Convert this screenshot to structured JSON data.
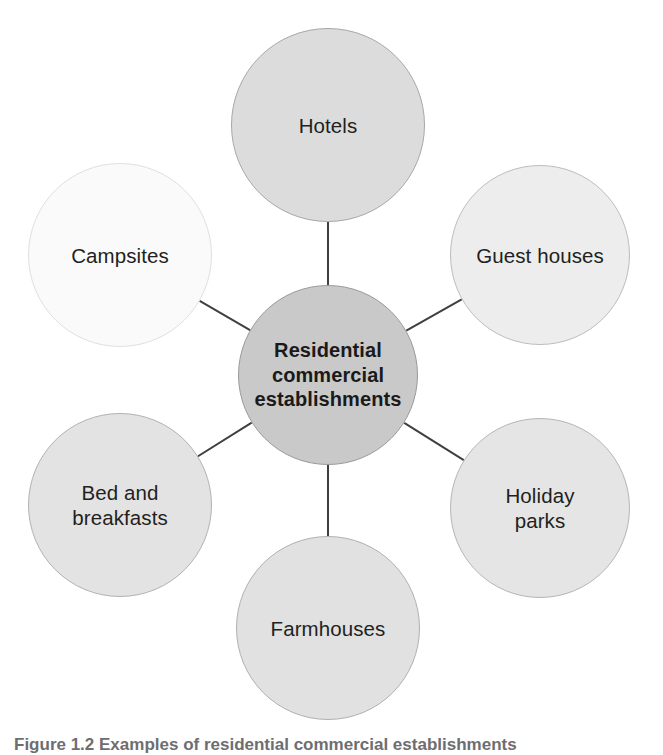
{
  "figure": {
    "type": "radial-hub-and-spoke-diagram",
    "background_color": "#ffffff",
    "width": 663,
    "height": 752,
    "spoke_color": "#3f3f42",
    "spoke_width": 2
  },
  "center": {
    "label": "Residential\ncommercial\nestablishments",
    "line1": "Residential",
    "line2": "commercial",
    "line3": "establishments",
    "fill": "#c9c9c9",
    "border": "#9a9a9a",
    "text_color": "#1a1a1a",
    "cx": 328,
    "cy": 375,
    "r": 90
  },
  "nodes": [
    {
      "id": "hotels",
      "label": "Hotels",
      "fill": "#dcdcdc",
      "border": "#a8a8a8",
      "cx": 328,
      "cy": 125,
      "r": 97
    },
    {
      "id": "guest-houses",
      "label": "Guest houses",
      "fill": "#ededed",
      "border": "#bdbdbd",
      "cx": 540,
      "cy": 255,
      "r": 90
    },
    {
      "id": "holiday-parks",
      "label": "Holiday\nparks",
      "fill": "#e5e5e5",
      "border": "#b5b5b5",
      "cx": 540,
      "cy": 508,
      "r": 90
    },
    {
      "id": "farmhouses",
      "label": "Farmhouses",
      "fill": "#e1e1e1",
      "border": "#b0b0b0",
      "cx": 328,
      "cy": 628,
      "r": 92
    },
    {
      "id": "bed-and-breakfasts",
      "label": "Bed and\nbreakfasts",
      "fill": "#e3e3e3",
      "border": "#b2b2b2",
      "cx": 120,
      "cy": 505,
      "r": 92
    },
    {
      "id": "campsites",
      "label": "Campsites",
      "fill": "#fafafa",
      "border": "#e0e0e0",
      "cx": 120,
      "cy": 255,
      "r": 92
    }
  ],
  "caption": {
    "text": "Figure 1.2 Examples of residential commercial establishments",
    "note": "clipped at bottom edge of image"
  }
}
